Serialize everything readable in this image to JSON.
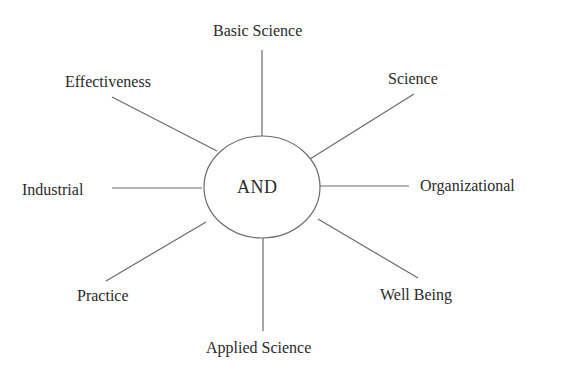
{
  "diagram": {
    "center": {
      "label": "AND",
      "cx": 262,
      "cy": 187,
      "rx": 58,
      "ry": 51
    },
    "nodes": [
      {
        "id": "basic-science",
        "label": "Basic Science",
        "direction": "top"
      },
      {
        "id": "science",
        "label": "Science",
        "direction": "top-right"
      },
      {
        "id": "organizational",
        "label": "Organizational",
        "direction": "right"
      },
      {
        "id": "well-being",
        "label": "Well Being",
        "direction": "bottom-right"
      },
      {
        "id": "applied-science",
        "label": "Applied Science",
        "direction": "bottom"
      },
      {
        "id": "practice",
        "label": "Practice",
        "direction": "bottom-left"
      },
      {
        "id": "industrial",
        "label": "Industrial",
        "direction": "left"
      },
      {
        "id": "effectiveness",
        "label": "Effectiveness",
        "direction": "top-left"
      }
    ],
    "colors": {
      "line": "#6a6a6a",
      "text": "#2a2a2a",
      "background": "#ffffff"
    }
  }
}
